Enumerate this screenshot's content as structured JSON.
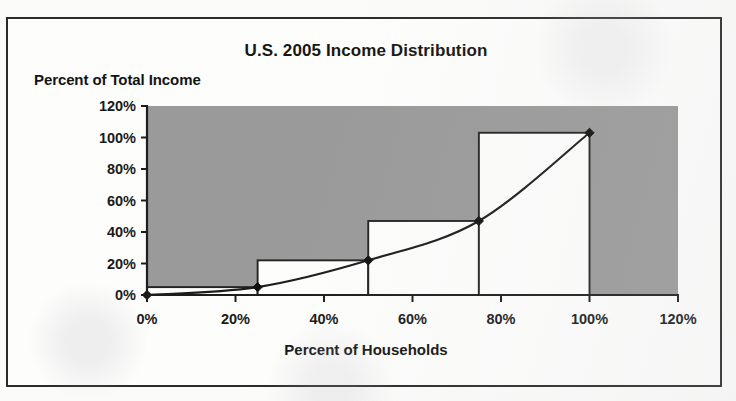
{
  "chart_data": {
    "type": "bar",
    "title": "U.S. 2005 Income Distribution",
    "xlabel": "Percent of Households",
    "ylabel": "Percent of Total Income",
    "xlim": [
      0,
      120
    ],
    "ylim": [
      0,
      120
    ],
    "xticks": [
      "0%",
      "20%",
      "40%",
      "60%",
      "80%",
      "100%",
      "120%"
    ],
    "xtick_values": [
      0,
      20,
      40,
      60,
      80,
      100,
      120
    ],
    "yticks": [
      "0%",
      "20%",
      "40%",
      "60%",
      "80%",
      "100%",
      "120%"
    ],
    "ytick_values": [
      0,
      20,
      40,
      60,
      80,
      100,
      120
    ],
    "grid": false,
    "legend": "none",
    "plot_background_color": "#9a9a9a",
    "bar_fill_color": "#fdfdfc",
    "bar_border_color": "#232323",
    "line_color": "#1c1c1c",
    "marker_color": "#111111",
    "categories": [
      "0%-25%",
      "25%-50%",
      "50%-75%",
      "75%-100%"
    ],
    "bars": [
      {
        "label": "0%-25%",
        "x_start": 0,
        "x_end": 25,
        "value": 5
      },
      {
        "label": "25%-50%",
        "x_start": 25,
        "x_end": 50,
        "value": 22
      },
      {
        "label": "50%-75%",
        "x_start": 50,
        "x_end": 75,
        "value": 47
      },
      {
        "label": "75%-100%",
        "x_start": 75,
        "x_end": 100,
        "value": 103
      }
    ],
    "values": [
      5,
      22,
      47,
      103
    ],
    "series": [
      {
        "name": "Cumulative income share",
        "type": "line",
        "x": [
          0,
          25,
          50,
          75,
          100
        ],
        "values": [
          0,
          5,
          22,
          47,
          103
        ]
      }
    ]
  }
}
